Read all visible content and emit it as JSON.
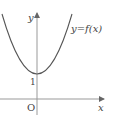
{
  "figure": {
    "type": "function-graph",
    "x_axis_label": "x",
    "y_axis_label": "y",
    "origin_label": "O",
    "y_intercept_label": "1",
    "curve_label": "y=f(x)",
    "curve_shape": "upward parabola with vertex on y-axis at y=1",
    "colors": {
      "axis": "#888888",
      "curve": "#555555",
      "text": "#444444"
    }
  }
}
